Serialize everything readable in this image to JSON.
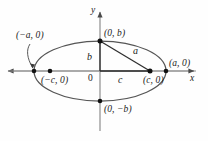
{
  "figure": {
    "background_color": "#fefefe",
    "stroke_color": "#4a4a4a",
    "curve_color": "#555555",
    "text_color": "#1a1a1a",
    "width": 208,
    "height": 141
  },
  "axes": {
    "x_label": "x",
    "y_label": "y",
    "origin_label": "0",
    "x_axis_y": 71,
    "y_axis_x": 100,
    "x_min": 6,
    "x_max": 196,
    "y_min": 10,
    "y_max": 131
  },
  "ellipse": {
    "center_x": 100,
    "center_y": 71,
    "semi_major_px": 66,
    "semi_minor_px": 30,
    "focus_offset_px": 50
  },
  "labels": {
    "left_vertex": "(−a, 0)",
    "right_vertex": "(a, 0)",
    "top_vertex": "(0, b)",
    "bottom_vertex": "(0, −b)",
    "left_focus": "(−c, 0)",
    "right_focus": "(c, 0)",
    "semi_minor": "b",
    "semi_focal": "c",
    "semi_major": "a"
  },
  "points": [
    {
      "name": "left-vertex",
      "label": "(−a, 0)",
      "x": 34,
      "y": 71
    },
    {
      "name": "left-focus",
      "label": "(−c, 0)",
      "x": 50,
      "y": 71
    },
    {
      "name": "right-focus",
      "label": "(c, 0)",
      "x": 150,
      "y": 71
    },
    {
      "name": "right-vertex",
      "label": "(a, 0)",
      "x": 166,
      "y": 71
    },
    {
      "name": "top-vertex",
      "label": "(0, b)",
      "x": 100,
      "y": 41
    },
    {
      "name": "bottom-vertex",
      "label": "(0, −b)",
      "x": 100,
      "y": 101
    }
  ],
  "segments": [
    {
      "name": "semi-major-hypotenuse",
      "label": "a",
      "from": "top-vertex",
      "to": "right-focus"
    },
    {
      "name": "semi-minor-vertical",
      "label": "b",
      "from": "origin",
      "to": "top-vertex"
    },
    {
      "name": "focal-horizontal",
      "label": "c",
      "from": "origin",
      "to": "right-focus"
    }
  ],
  "leader": {
    "name": "left-vertex-leader",
    "from_label": "(−a, 0)",
    "to_point": "left-vertex"
  }
}
